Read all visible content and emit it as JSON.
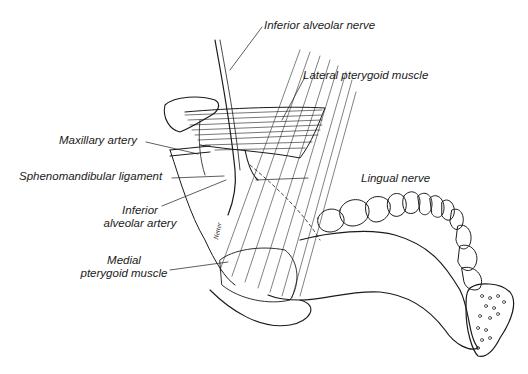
{
  "figure": {
    "labels": {
      "inferior_alveolar_nerve": "Inferior alveolar nerve",
      "lateral_pterygoid_muscle": "Lateral pterygoid muscle",
      "maxillary_artery": "Maxillary artery",
      "sphenomandibular_ligament": "Sphenomandibular ligament",
      "lingual_nerve": "Lingual nerve",
      "inferior_alveolar_artery_line1": "Inferior",
      "inferior_alveolar_artery_line2": "alveolar artery",
      "medial_pterygoid_muscle_line1": "Medial",
      "medial_pterygoid_muscle_line2": "pterygoid muscle"
    },
    "signature": "Netter",
    "colors": {
      "ink": "#1a1a1a",
      "background": "#ffffff"
    }
  }
}
